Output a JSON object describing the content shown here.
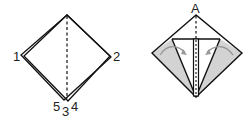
{
  "diagram": {
    "left_figure": {
      "labels": {
        "corner_left": "1",
        "corner_right": "2",
        "bottom_left": "5",
        "bottom_center": "3",
        "bottom_right": "4"
      }
    },
    "right_figure": {
      "labels": {
        "top": "A"
      }
    },
    "colors": {
      "line": "#111111",
      "shade": "#d3d3d3",
      "arrow": "#999999"
    }
  }
}
